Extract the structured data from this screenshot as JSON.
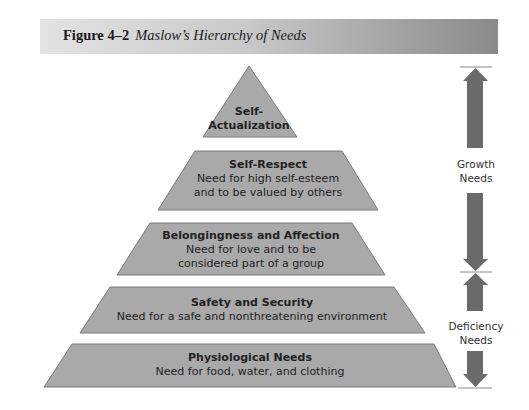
{
  "header": {
    "figure_number": "Figure 4–2",
    "figure_title": "Maslow’s Hierarchy of Needs"
  },
  "colors": {
    "tier_fill": "#a9a9a9",
    "tier_stroke": "#6f6f6f",
    "arrow_fill": "#6a6a6a",
    "text": "#222222"
  },
  "pyramid": {
    "tiers": [
      {
        "title": "Self-",
        "title2": "Actualization",
        "description": ""
      },
      {
        "title": "Self-Respect",
        "description_line1": "Need for high self-esteem",
        "description_line2": "and to be valued by others"
      },
      {
        "title": "Belongingness and Affection",
        "description_line1": "Need for love and to be",
        "description_line2": "considered part of a group"
      },
      {
        "title": "Safety and Security",
        "description_line1": "Need for a safe and nonthreatening environment"
      },
      {
        "title": "Physiological Needs",
        "description_line1": "Need for food, water, and clothing"
      }
    ]
  },
  "side_labels": {
    "growth": {
      "line1": "Growth",
      "line2": "Needs"
    },
    "deficiency": {
      "line1": "Deficiency",
      "line2": "Needs"
    }
  }
}
